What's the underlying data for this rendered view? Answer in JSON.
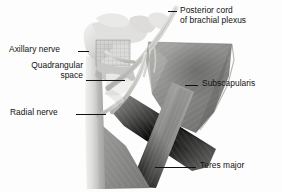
{
  "figure": {
    "background_color": "#fdfdfd",
    "label_color": "#111111"
  },
  "labels": [
    {
      "id": "axillary-nerve",
      "text": "Axillary nerve",
      "side": "left",
      "leader": "short-dash"
    },
    {
      "id": "quadrangular-space",
      "text": "Quadrangular\nspace",
      "line1": "Quadrangular",
      "line2": "space",
      "side": "left",
      "leader": "long-dash"
    },
    {
      "id": "radial-nerve",
      "text": "Radial nerve",
      "side": "left",
      "leader": "medium-dash"
    },
    {
      "id": "posterior-cord",
      "text": "Posterior cord of brachial plexus",
      "line1": "Posterior cord",
      "line2": "of brachial plexus",
      "side": "right",
      "leader": "short-dash"
    },
    {
      "id": "subscapularis",
      "text": "Subscapularis",
      "side": "right",
      "leader": "short-dash"
    },
    {
      "id": "teres-major",
      "text": "Teres major",
      "side": "right",
      "leader": "long-dash"
    }
  ],
  "structures": {
    "bone_light": "#d9d9d7",
    "bone_mid": "#bdbdbb",
    "muscle_dark": "#8e8e8c",
    "muscle_darker": "#747472",
    "muscle_mid": "#a3a3a1",
    "nerve": "#cfcfcc",
    "shadow": "#5f5f5d"
  }
}
